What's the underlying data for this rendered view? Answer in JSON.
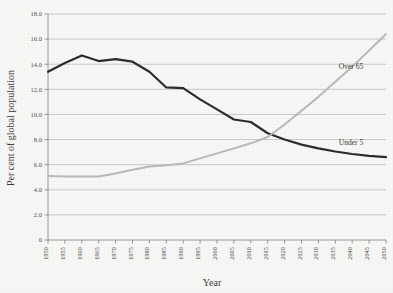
{
  "chart_data": {
    "type": "line",
    "title": "",
    "xlabel": "Year",
    "ylabel": "Per cent of global population",
    "xlim": [
      1950,
      2050
    ],
    "ylim": [
      0,
      18
    ],
    "ytick_step": 2,
    "grid": "horizontal",
    "legend_position": "inline-labels",
    "x": [
      1950,
      1955,
      1960,
      1965,
      1970,
      1975,
      1980,
      1985,
      1990,
      1995,
      2000,
      2005,
      2010,
      2015,
      2020,
      2025,
      2030,
      2035,
      2040,
      2045,
      2050
    ],
    "xtick_labels": [
      "1950",
      "1955",
      "1960",
      "1965",
      "1970",
      "1975",
      "1980",
      "1985",
      "1990",
      "1995",
      "2000",
      "2005",
      "2010",
      "2015",
      "2020",
      "2025",
      "2030",
      "2035",
      "2040",
      "2045",
      "2050"
    ],
    "ytick_labels": [
      "0",
      "2.0",
      "4.0",
      "6.0",
      "8.0",
      "10.0",
      "12.0",
      "14.0",
      "16.0",
      "18.0"
    ],
    "series": [
      {
        "name": "Under 5",
        "label": "Under 5",
        "color": "#2c2c2c",
        "width": 2.2,
        "values": [
          13.4,
          14.1,
          14.7,
          14.25,
          14.4,
          14.2,
          13.4,
          12.15,
          12.1,
          11.2,
          10.4,
          9.6,
          9.4,
          8.5,
          8.0,
          7.6,
          7.3,
          7.05,
          6.85,
          6.7,
          6.6
        ]
      },
      {
        "name": "Over 65",
        "label": "Over 65",
        "color": "#b9b9b9",
        "width": 2.0,
        "values": [
          5.1,
          5.05,
          5.05,
          5.05,
          5.3,
          5.6,
          5.85,
          5.95,
          6.1,
          6.5,
          6.9,
          7.3,
          7.7,
          8.2,
          9.2,
          10.3,
          11.4,
          12.6,
          13.8,
          15.1,
          16.4
        ]
      }
    ],
    "annotations": [
      {
        "text": "Over 65",
        "series": "Over 65",
        "x": 2036,
        "y": 13.6
      },
      {
        "text": "Under 5",
        "series": "Under 5",
        "x": 2036,
        "y": 7.6
      }
    ]
  }
}
